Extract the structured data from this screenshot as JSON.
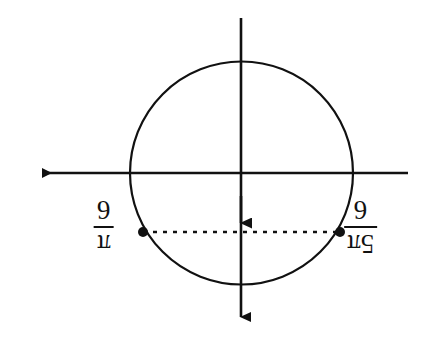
{
  "figure": {
    "orientation": "rotated-180",
    "background_color": "#ffffff",
    "stroke_color": "#111111"
  },
  "circle": {
    "center_x": 241.5,
    "center_y": 173,
    "radius": 111.5,
    "stroke_width": 2.2
  },
  "axes": {
    "horizontal": {
      "y": 173,
      "x_start": 408,
      "x_end": 30,
      "arrow_at": "left",
      "stroke_width": 2.6
    },
    "vertical": {
      "x": 241,
      "y_start": 18,
      "y_end": 328,
      "arrow_at": "bottom",
      "stroke_width": 2.6
    },
    "mid_arrow": {
      "x": 241,
      "y_tip": 234,
      "note": "second arrowhead meeting the dashed chord"
    }
  },
  "chord": {
    "y": 232,
    "x_left": 143,
    "x_right": 340,
    "style": "dotted",
    "stroke_width": 2.6,
    "dash_pattern": "4 6"
  },
  "points": [
    {
      "name": "left-point",
      "x": 143,
      "y": 232,
      "radius": 5
    },
    {
      "name": "right-point",
      "x": 340,
      "y": 232,
      "radius": 5
    }
  ],
  "labels": {
    "left": {
      "numerator": "π",
      "denominator": "6",
      "text": "π/6"
    },
    "right": {
      "numerator": "5π",
      "denominator": "6",
      "text": "5π/6"
    }
  }
}
